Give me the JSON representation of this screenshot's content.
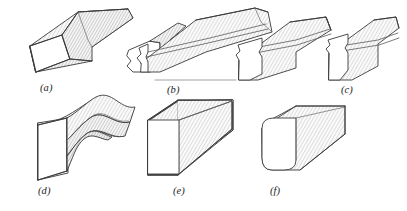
{
  "figure": {
    "background_color": "#ffffff",
    "outline_color": "#3a3a3a",
    "hatch_color": "#9a9a9a",
    "face_fill_light": "#ffffff",
    "face_fill_hatched": "#f2f2f2",
    "caption_color": "#1c1c1c",
    "ground_line_color": "#8c8c8c"
  },
  "captions": [
    {
      "key": "a",
      "label": "(a)",
      "x": 40,
      "y": 82
    },
    {
      "key": "b",
      "label": "(b)",
      "x": 167,
      "y": 84
    },
    {
      "key": "c",
      "label": "(c)",
      "x": 341,
      "y": 84
    },
    {
      "key": "d",
      "label": "(d)",
      "x": 38,
      "y": 185
    },
    {
      "key": "e",
      "label": "(e)",
      "x": 173,
      "y": 185
    },
    {
      "key": "f",
      "label": "(f)",
      "x": 270,
      "y": 185
    }
  ],
  "parts": [
    {
      "key": "a",
      "name": "tapered-bar-blank",
      "description": "Tapered rectangular bar stock shown in isometric view with hatched top and side faces and a plain trapezoidal end face."
    },
    {
      "key": "b",
      "name": "notched-bar-two-views",
      "description": "Bar with a notched, fullered end; two stages shown side by side above a horizontal ground reference line."
    },
    {
      "key": "c",
      "name": "necked-bar",
      "description": "Bar with a necked-in shoulder formed near the end face."
    },
    {
      "key": "d",
      "name": "bent-bar",
      "description": "Bar bent into an S-curve along its length with a square end face."
    },
    {
      "key": "e",
      "name": "square-bar",
      "description": "Straight square-section bar with sharp corners."
    },
    {
      "key": "f",
      "name": "rounded-square-bar",
      "description": "Straight square-section bar with rounded corners on the end face."
    }
  ],
  "ground_line": {
    "name": "ground-reference-line",
    "x1": 155,
    "y1": 80,
    "x2": 236,
    "y2": 80
  }
}
